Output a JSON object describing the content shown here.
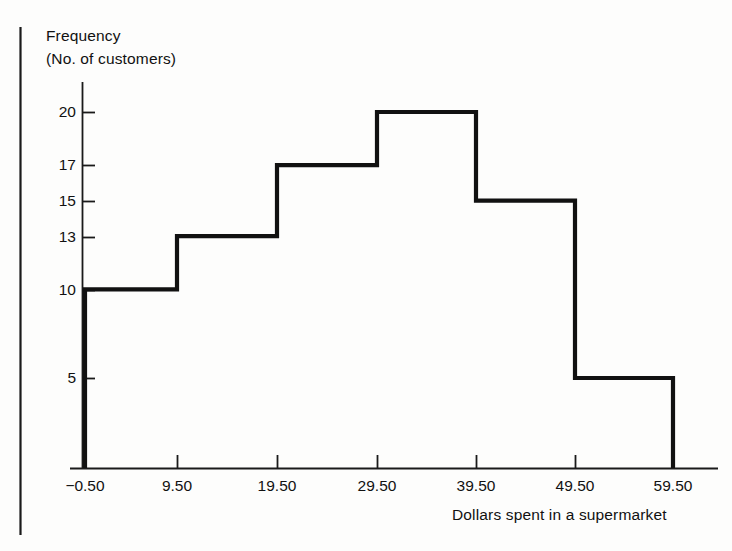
{
  "figure": {
    "background_color": "#fdfdfc",
    "ink_color": "#111111",
    "border_line": {
      "x": 20,
      "y_top": 27,
      "y_bottom": 535
    }
  },
  "axes": {
    "y_title_line1": "Frequency",
    "y_title_line2": "(No. of customers)",
    "x_title": "Dollars spent in a supermarket",
    "y_ticks": [
      {
        "label": "20",
        "value": 20,
        "y": 112
      },
      {
        "label": "17",
        "value": 17,
        "y": 165
      },
      {
        "label": "15",
        "value": 15,
        "y": 201
      },
      {
        "label": "13",
        "value": 13,
        "y": 237
      },
      {
        "label": "10",
        "value": 10,
        "y": 290
      },
      {
        "label": "5",
        "value": 5,
        "y": 378
      }
    ],
    "x_ticks": [
      {
        "label": "−0.50",
        "value": -0.5,
        "x": 85
      },
      {
        "label": "9.50",
        "value": 9.5,
        "x": 177
      },
      {
        "label": "19.50",
        "value": 19.5,
        "x": 277
      },
      {
        "label": "29.50",
        "value": 29.5,
        "x": 377
      },
      {
        "label": "39.50",
        "value": 39.5,
        "x": 476
      },
      {
        "label": "49.50",
        "value": 49.5,
        "x": 575
      },
      {
        "label": "59.50",
        "value": 59.5,
        "x": 673
      }
    ],
    "x_axis_line": {
      "x_start": 70,
      "x_end": 718,
      "y": 468
    },
    "y_axis_line": {
      "x": 82,
      "y_top": 82,
      "y_bottom": 468
    }
  },
  "chart_data": {
    "type": "bar",
    "title": "",
    "subtitle": "",
    "xlabel": "Dollars spent in a supermarket",
    "ylabel": "Frequency (No. of customers)",
    "bin_edges": [
      -0.5,
      9.5,
      19.5,
      29.5,
      39.5,
      49.5,
      59.5
    ],
    "categories": [
      "-0.50 to 9.50",
      "9.50 to 19.50",
      "19.50 to 29.50",
      "29.50 to 39.50",
      "39.50 to 49.50",
      "49.50 to 59.50"
    ],
    "values": [
      10,
      13,
      17,
      20,
      15,
      5
    ],
    "xlim": [
      -0.5,
      59.5
    ],
    "ylim": [
      0,
      20
    ],
    "ytick_values": [
      5,
      10,
      13,
      15,
      17,
      20
    ],
    "xtick_values": [
      -0.5,
      9.5,
      19.5,
      29.5,
      39.5,
      49.5,
      59.5
    ],
    "grid": false,
    "legend": false,
    "style": "outline-step-histogram",
    "total_customers": 80
  },
  "geometry": {
    "outline_path": "M 85,468 L 85,290 L 177,290 L 177,237 L 277,237 L 277,165 L 377,165 L 377,112 L 476,112 L 476,201 L 575,201 L 575,378 L 673,378 L 673,468",
    "stroke_width": 4.2
  }
}
